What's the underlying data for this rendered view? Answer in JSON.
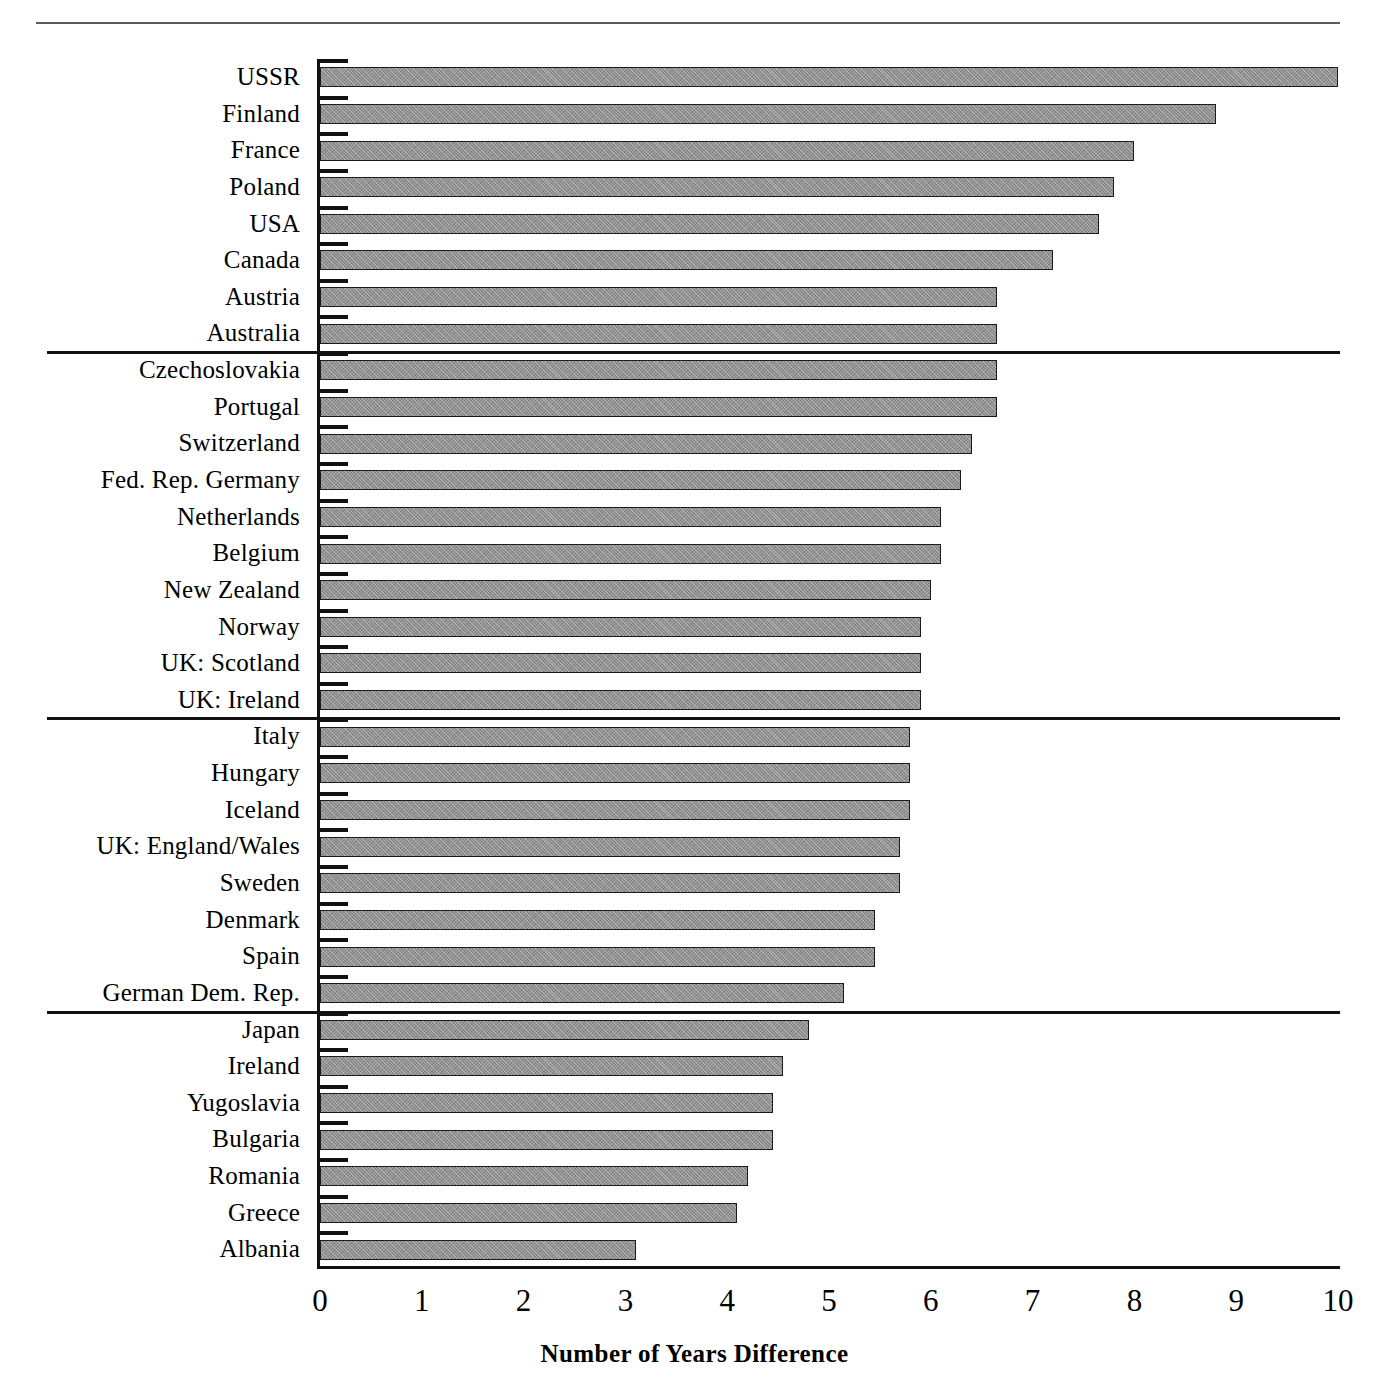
{
  "figure": {
    "has_top_rule": true,
    "x_axis_title": "Number of Years Difference"
  },
  "axis": {
    "x_ticks": [
      "0",
      "1",
      "2",
      "3",
      "4",
      "5",
      "6",
      "7",
      "8",
      "9",
      "10"
    ]
  },
  "style": {
    "bar_fill": "#8f8f8f",
    "bar_stroke": "#1b1b1b",
    "axis_color": "#111111",
    "text_color": "#000000"
  },
  "chart_data": {
    "type": "bar",
    "orientation": "horizontal",
    "title": "",
    "subtitle": "",
    "xlabel": "Number of Years Difference",
    "ylabel": "",
    "xlim": [
      0,
      10
    ],
    "xticks": [
      0,
      1,
      2,
      3,
      4,
      5,
      6,
      7,
      8,
      9,
      10
    ],
    "grid": false,
    "legend": null,
    "categories": [
      "USSR",
      "Finland",
      "France",
      "Poland",
      "USA",
      "Canada",
      "Austria",
      "Australia",
      "Czechoslovakia",
      "Portugal",
      "Switzerland",
      "Fed. Rep. Germany",
      "Netherlands",
      "Belgium",
      "New Zealand",
      "Norway",
      "UK: Scotland",
      "UK: Ireland",
      "Italy",
      "Hungary",
      "Iceland",
      "UK: England/Wales",
      "Sweden",
      "Denmark",
      "Spain",
      "German Dem. Rep.",
      "Japan",
      "Ireland",
      "Yugoslavia",
      "Bulgaria",
      "Romania",
      "Greece",
      "Albania"
    ],
    "values": [
      10.0,
      8.8,
      8.0,
      7.8,
      7.65,
      7.2,
      6.65,
      6.65,
      6.65,
      6.65,
      6.4,
      6.3,
      6.1,
      6.1,
      6.0,
      5.9,
      5.9,
      5.9,
      5.8,
      5.8,
      5.8,
      5.7,
      5.7,
      5.45,
      5.45,
      5.15,
      4.8,
      4.55,
      4.45,
      4.45,
      4.2,
      4.1,
      3.1
    ],
    "group_separators_after": [
      7,
      17,
      25
    ]
  }
}
